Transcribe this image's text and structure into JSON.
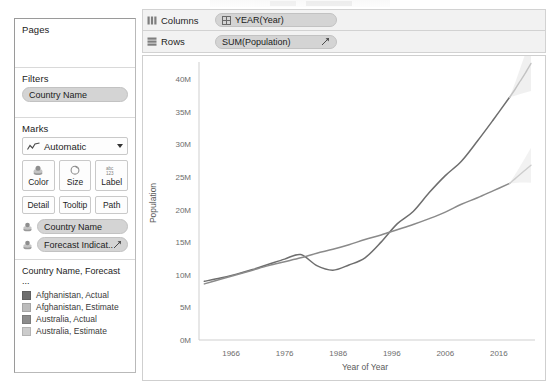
{
  "sidebar": {
    "pages": {
      "title": "Pages",
      "items": []
    },
    "filters": {
      "title": "Filters",
      "items": [
        {
          "label": "Country Name",
          "icon": "dimension-pill-icon"
        }
      ]
    },
    "marks": {
      "title": "Marks",
      "mark_type": {
        "label": "Automatic",
        "icon": "line-mark-icon",
        "caret": "chevron-down-icon"
      },
      "buttons": [
        {
          "label": "Color",
          "icon": "color-palette-icon"
        },
        {
          "label": "Size",
          "icon": "size-icon"
        },
        {
          "label": "Label",
          "icon": "abc-123-label-icon"
        },
        {
          "label": "Detail",
          "icon": "detail-icon"
        },
        {
          "label": "Tooltip",
          "icon": "tooltip-icon"
        },
        {
          "label": "Path",
          "icon": "path-icon"
        }
      ],
      "mark_pills": [
        {
          "label": "Country Name",
          "icon": "color-swatch-icon",
          "trailing": ""
        },
        {
          "label": "Forecast Indicat..",
          "icon": "color-swatch-icon",
          "trailing": "forecast-icon"
        }
      ]
    },
    "legend": {
      "title": "Country Name, Forecast ...",
      "items": [
        {
          "label": "Afghanistan, Actual",
          "color": "#6e6e6e"
        },
        {
          "label": "Afghanistan, Estimate",
          "color": "#bcbcbc"
        },
        {
          "label": "Australia, Actual",
          "color": "#8c8c8c"
        },
        {
          "label": "Australia, Estimate",
          "color": "#cccccc"
        }
      ]
    }
  },
  "worksheet": {
    "columns_shelf": {
      "label": "Columns",
      "icon": "columns-shelf-icon",
      "pills": [
        {
          "label": "YEAR(Year)",
          "icon": "date-pill-icon"
        }
      ]
    },
    "rows_shelf": {
      "label": "Rows",
      "icon": "rows-shelf-icon",
      "pills": [
        {
          "label": "SUM(Population)",
          "icon": "",
          "trailing": "forecast-icon"
        }
      ]
    }
  },
  "chart_data": {
    "type": "line",
    "title": "",
    "xlabel": "Year of Year",
    "ylabel": "Population",
    "xlim": [
      1960,
      2022
    ],
    "ylim": [
      0,
      42000000
    ],
    "xticks": [
      1966,
      1976,
      1986,
      1996,
      2006,
      2016
    ],
    "yticks": [
      0,
      5000000,
      10000000,
      15000000,
      20000000,
      25000000,
      30000000,
      35000000,
      40000000
    ],
    "ytick_labels": [
      "0M",
      "5M",
      "10M",
      "15M",
      "20M",
      "25M",
      "30M",
      "35M",
      "40M"
    ],
    "xtick_labels": [
      "1966",
      "1976",
      "1986",
      "1996",
      "2006",
      "2016"
    ],
    "grid": false,
    "legend_position": "left-sidebar",
    "series": [
      {
        "name": "Afghanistan, Actual",
        "color": "#6e6e6e",
        "kind": "actual",
        "x": [
          1961,
          1964,
          1967,
          1970,
          1973,
          1976,
          1979,
          1982,
          1985,
          1988,
          1991,
          1994,
          1997,
          2000,
          2003,
          2006,
          2009,
          2012,
          2015,
          2018
        ],
        "values": [
          9000000,
          9500000,
          10100000,
          10800000,
          11600000,
          12400000,
          13100000,
          11400000,
          10700000,
          11500000,
          12600000,
          15000000,
          17800000,
          19700000,
          22600000,
          25200000,
          27400000,
          30500000,
          33800000,
          37200000
        ]
      },
      {
        "name": "Afghanistan, Estimate",
        "color": "#c3c3c3",
        "kind": "estimate",
        "x": [
          2018,
          2019,
          2020,
          2021,
          2022
        ],
        "values": [
          37200000,
          38400000,
          39700000,
          41000000,
          42400000
        ]
      },
      {
        "name": "Australia, Actual",
        "color": "#8a8a8a",
        "kind": "actual",
        "x": [
          1961,
          1964,
          1967,
          1970,
          1973,
          1976,
          1979,
          1982,
          1985,
          1988,
          1991,
          1994,
          1997,
          2000,
          2003,
          2006,
          2009,
          2012,
          2015,
          2018
        ],
        "values": [
          8600000,
          9300000,
          10000000,
          10700000,
          11400000,
          12000000,
          12600000,
          13300000,
          13900000,
          14600000,
          15400000,
          16100000,
          16900000,
          17700000,
          18600000,
          19600000,
          20800000,
          21800000,
          22900000,
          24000000
        ]
      },
      {
        "name": "Australia, Estimate",
        "color": "#cdcdcd",
        "kind": "estimate",
        "x": [
          2018,
          2019,
          2020,
          2021,
          2022
        ],
        "values": [
          24000000,
          24700000,
          25400000,
          26100000,
          26800000
        ]
      }
    ],
    "forecast_bands": [
      {
        "name": "Afghanistan, Estimate band",
        "color": "#e3e3e3"
      },
      {
        "name": "Australia, Estimate band",
        "color": "#e8e8e8"
      }
    ]
  }
}
